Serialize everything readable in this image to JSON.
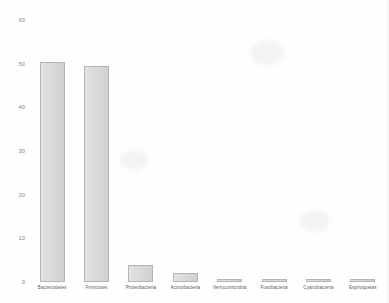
{
  "chart_data": {
    "type": "bar",
    "title": "",
    "subtitle": "",
    "xlabel": "",
    "ylabel": "",
    "categories": [
      "Bacteroidetes",
      "Firmicutes",
      "Proteobacteria",
      "Actinobacteria",
      "Verrucomicrobia",
      "Fusobacteria",
      "Cyanobacteria",
      "Espiroquetas"
    ],
    "values": [
      50.3,
      49.5,
      3.8,
      2.1,
      0.8,
      0.8,
      0.7,
      0.7
    ],
    "ylim": [
      0,
      60
    ],
    "yticks": [
      0,
      10,
      20,
      30,
      40,
      50,
      60
    ],
    "ytick_labels": [
      "0",
      "10",
      "20",
      "30",
      "40",
      "50",
      "60"
    ],
    "grid": false,
    "legend": false,
    "legend_position": "none",
    "bar_fill_color": "#d9d9d9",
    "bar_border_color": "#b4b4b4",
    "background_color": "#fefefe",
    "axis_text_color": "#7b7b7b"
  }
}
